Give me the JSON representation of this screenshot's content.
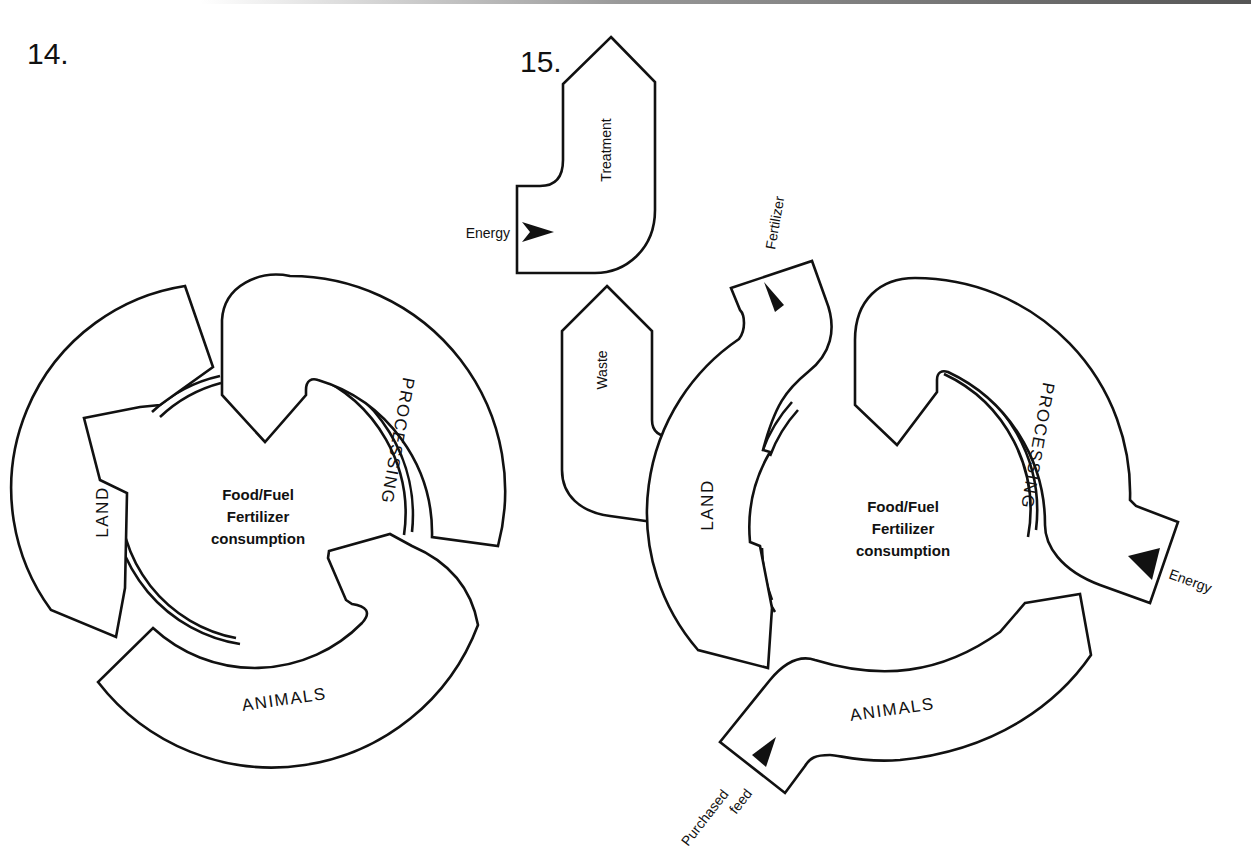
{
  "figures": [
    {
      "number": "14.",
      "center_lines": [
        "Food/Fuel",
        "Fertilizer",
        "consumption"
      ],
      "stages": {
        "land": "LAND",
        "processing": "PROCESSING",
        "animals": "ANIMALS"
      }
    },
    {
      "number": "15.",
      "center_lines": [
        "Food/Fuel",
        "Fertilizer",
        "consumption"
      ],
      "stages": {
        "land": "LAND",
        "processing": "PROCESSING",
        "animals": "ANIMALS"
      },
      "side_units": {
        "treatment": "Treatment",
        "waste": "Waste"
      },
      "inputs": {
        "treatment_energy": "Energy",
        "fertilizer": "Fertilizer",
        "processing_energy": "Energy",
        "purchased_feed_line1": "Purchased",
        "purchased_feed_line2": "feed"
      }
    }
  ]
}
